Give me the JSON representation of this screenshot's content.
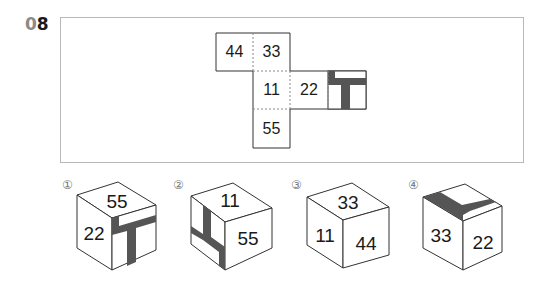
{
  "question": {
    "number_prefix": "0",
    "number_suffix": "8"
  },
  "net": {
    "faces": [
      {
        "id": "face-44",
        "label": "44"
      },
      {
        "id": "face-33",
        "label": "33"
      },
      {
        "id": "face-11",
        "label": "11"
      },
      {
        "id": "face-22",
        "label": "22"
      },
      {
        "id": "face-t-pattern",
        "label": ""
      },
      {
        "id": "face-55",
        "label": "55"
      }
    ]
  },
  "options": [
    {
      "marker": "①",
      "faces": {
        "top": "55",
        "left": "22",
        "right": "T-pattern"
      }
    },
    {
      "marker": "②",
      "faces": {
        "top": "11",
        "left": "T-pattern",
        "right": "55"
      }
    },
    {
      "marker": "③",
      "faces": {
        "top": "33",
        "left": "11",
        "right": "44"
      }
    },
    {
      "marker": "④",
      "faces": {
        "top": "T-pattern",
        "left": "33",
        "right": "22"
      }
    }
  ],
  "colors": {
    "line": "#333333",
    "dotted": "#888888",
    "fill_dark": "#555555",
    "frame": "#b8b8b8"
  }
}
